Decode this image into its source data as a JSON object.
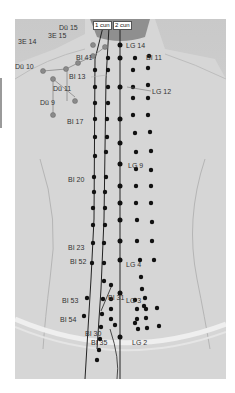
{
  "figure": {
    "measure_labels": [
      {
        "text": "1 cun",
        "x": 78,
        "y": 2
      },
      {
        "text": "2 cun",
        "x": 98,
        "y": 2
      }
    ],
    "point_labels": [
      {
        "text": "Dü 15",
        "x": 44,
        "y": 5
      },
      {
        "text": "3E 15",
        "x": 33,
        "y": 13
      },
      {
        "text": "3E 14",
        "x": 3,
        "y": 19
      },
      {
        "text": "Dü 10",
        "x": 0,
        "y": 44
      },
      {
        "text": "Dü 11",
        "x": 38,
        "y": 66
      },
      {
        "text": "Dü 9",
        "x": 25,
        "y": 80
      },
      {
        "text": "BI 41",
        "x": 61,
        "y": 35
      },
      {
        "text": "BI 13",
        "x": 54,
        "y": 54
      },
      {
        "text": "BI 17",
        "x": 52,
        "y": 99
      },
      {
        "text": "BI 20",
        "x": 53,
        "y": 157
      },
      {
        "text": "BI 23",
        "x": 53,
        "y": 225
      },
      {
        "text": "BI 52",
        "x": 55,
        "y": 239
      },
      {
        "text": "BI 53",
        "x": 47,
        "y": 278
      },
      {
        "text": "BI 54",
        "x": 45,
        "y": 297
      },
      {
        "text": "BI 31",
        "x": 93,
        "y": 275
      },
      {
        "text": "BI 30",
        "x": 70,
        "y": 311
      },
      {
        "text": "BI 35",
        "x": 76,
        "y": 320
      },
      {
        "text": "LG 14",
        "x": 111,
        "y": 23
      },
      {
        "text": "BI 11",
        "x": 131,
        "y": 35
      },
      {
        "text": "LG 12",
        "x": 137,
        "y": 69
      },
      {
        "text": "LG 9",
        "x": 113,
        "y": 143
      },
      {
        "text": "LG 4",
        "x": 111,
        "y": 242
      },
      {
        "text": "LG 3",
        "x": 111,
        "y": 278
      },
      {
        "text": "LG 2",
        "x": 117,
        "y": 320
      }
    ],
    "colors": {
      "meridian_point": "#111111",
      "small_intestine_point": "#8a8a8a",
      "line": "#222222",
      "label_text": "#333333"
    }
  }
}
